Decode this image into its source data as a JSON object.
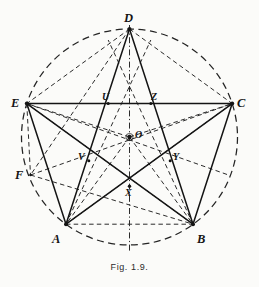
{
  "figure": {
    "caption": "Fig. 1.9.",
    "colors": {
      "ink": "#141414",
      "paper": "#fbfbf9",
      "solid_line": "#1a1a1a",
      "dashed_line": "#2b2b2b"
    },
    "circle": {
      "center_label": "O",
      "center_x": 129.5,
      "center_y": 137,
      "radius": 108,
      "stroke": "dashed"
    },
    "vertices": [
      {
        "label": "D",
        "x": 129.5,
        "y": 29,
        "label_x": 124,
        "label_y": 12,
        "position": "top"
      },
      {
        "label": "C",
        "x": 232.2,
        "y": 103.6,
        "label_x": 237,
        "label_y": 98,
        "position": "right"
      },
      {
        "label": "B",
        "x": 193.0,
        "y": 224.2,
        "label_x": 196,
        "label_y": 233,
        "position": "bottom-right"
      },
      {
        "label": "A",
        "x": 66.0,
        "y": 224.2,
        "label_x": 51,
        "label_y": 233,
        "position": "bottom-left"
      },
      {
        "label": "E",
        "x": 26.8,
        "y": 103.6,
        "label_x": 11,
        "label_y": 98,
        "position": "left"
      }
    ],
    "inner_points": [
      {
        "label": "U",
        "x": 108.2,
        "y": 103.6,
        "label_x": 101,
        "label_y": 93,
        "note": "intersection of DA with EC"
      },
      {
        "label": "Z",
        "x": 150.8,
        "y": 103.6,
        "label_x": 151,
        "label_y": 93,
        "note": "intersection of DB with EC"
      },
      {
        "label": "V",
        "x": 88.8,
        "y": 160.8,
        "label_x": 78,
        "label_y": 152,
        "note": "intersection of DA with EB"
      },
      {
        "label": "Y",
        "x": 170.2,
        "y": 160.8,
        "label_x": 172,
        "label_y": 152,
        "note": "intersection of DB with AC"
      },
      {
        "label": "X",
        "x": 129.5,
        "y": 186.2,
        "label_x": 125,
        "label_y": 188,
        "note": "intersection of AC with EB"
      },
      {
        "label": "O",
        "x": 129.5,
        "y": 137.0,
        "label_x": 134,
        "label_y": 130,
        "note": "centre of circle"
      },
      {
        "label": "F",
        "x": 30.5,
        "y": 175.0,
        "label_x": 17,
        "label_y": 171,
        "note": "point on the circle, lower left arc"
      }
    ],
    "solid_edges": [
      {
        "from": "E",
        "to": "C",
        "note": "horizontal diagonal"
      },
      {
        "from": "D",
        "to": "A",
        "note": "pentagram chord"
      },
      {
        "from": "D",
        "to": "B",
        "note": "pentagram chord"
      },
      {
        "from": "E",
        "to": "B",
        "note": "pentagram chord"
      },
      {
        "from": "A",
        "to": "C",
        "note": "pentagram chord"
      },
      {
        "from": "E",
        "to": "A",
        "note": "pentagon side"
      },
      {
        "from": "C",
        "to": "B",
        "note": "pentagon side"
      }
    ],
    "dashed_edges": [
      {
        "from": "A",
        "to": "B",
        "note": "pentagon side"
      },
      {
        "from": "D",
        "to": "E",
        "note": "pentagon side"
      },
      {
        "from": "D",
        "to": "C",
        "note": "pentagon side"
      },
      {
        "from": "O",
        "to": "D",
        "note": "radius / vertical axis"
      },
      {
        "from": "O",
        "to": "A",
        "note": "radius"
      },
      {
        "from": "O",
        "to": "B",
        "note": "radius"
      },
      {
        "from": "O",
        "to": "E",
        "note": "radius"
      },
      {
        "from": "O",
        "to": "C",
        "note": "radius"
      },
      {
        "from": "E",
        "to": "F",
        "note": "construction chord"
      },
      {
        "from": "F",
        "to": "C",
        "note": "construction chord"
      },
      {
        "from": "F",
        "to": "B",
        "note": "construction chord"
      },
      {
        "from": "D",
        "to": "F",
        "note": "construction chord"
      },
      {
        "from": "A",
        "to": "Z",
        "note": "construction chord extended to circle"
      },
      {
        "from": "E",
        "to": "Y",
        "note": "construction chord"
      }
    ],
    "vertical_axis": {
      "x": 129.5,
      "y_top": 25,
      "y_bottom": 252,
      "stroke": "dash-dot"
    }
  }
}
